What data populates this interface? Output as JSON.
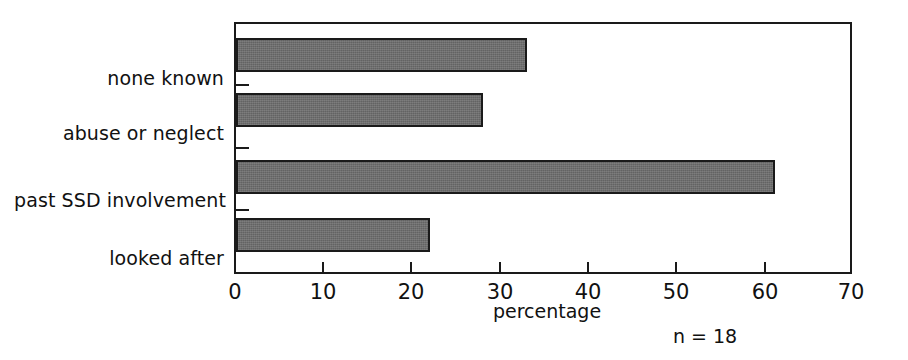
{
  "chart_data": {
    "type": "bar",
    "orientation": "horizontal",
    "title": "",
    "subtitle": "",
    "categories": [
      "none known",
      "abuse or neglect",
      "past SSD involvement",
      "looked after"
    ],
    "values": [
      33,
      28,
      61,
      22
    ],
    "xlabel": "percentage",
    "ylabel": "",
    "xlim": [
      0,
      70
    ],
    "xticks": [
      0,
      10,
      20,
      30,
      40,
      50,
      60,
      70
    ],
    "xtick_labels": [
      "0",
      "10",
      "20",
      "30",
      "40",
      "50",
      "60",
      "70"
    ],
    "grid": false,
    "legend": null,
    "annotations": [
      "n = 18"
    ],
    "bar_color": "#636363",
    "bar_edge_color": "#1a1a1a",
    "frame_color": "#1a1a1a",
    "background": "#ffffff"
  },
  "sample_size_label": "n = 18",
  "axis_title": "percentage"
}
